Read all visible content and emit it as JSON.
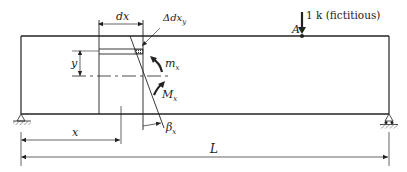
{
  "figure": {
    "type": "beam-virtual-work-diagram",
    "colors": {
      "ink": "#222222",
      "background": "#ffffff"
    },
    "labels": {
      "dx": "dx",
      "delta_dx_y": "Δdx",
      "delta_dx_y_sub": "y",
      "y": "y",
      "m_x": "m",
      "m_x_sub": "x",
      "M_x": "M",
      "M_x_sub": "x",
      "beta_x": "β",
      "beta_x_sub": "x",
      "x": "x",
      "L": "L",
      "point_A": "A",
      "load": "1 k (fictitious)"
    },
    "supports": {
      "left": "pin-support-icon",
      "right": "roller-support-icon"
    }
  }
}
